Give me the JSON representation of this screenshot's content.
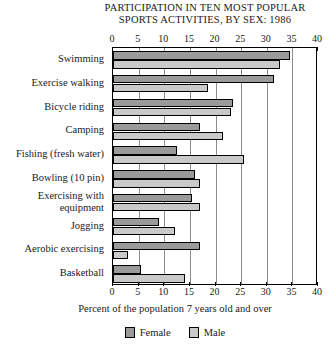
{
  "chart_data": {
    "type": "bar",
    "orientation": "horizontal",
    "title_line1": "PARTICIPATION IN TEN MOST POPULAR",
    "title_line2": "SPORTS ACTIVITIES, BY SEX: 1986",
    "xlabel": "Percent of the population 7 years old and over",
    "ylabel": "",
    "xlim": [
      0,
      40
    ],
    "xticks": [
      0,
      5,
      10,
      15,
      20,
      25,
      30,
      35,
      40
    ],
    "xtick_labels": [
      "0",
      "5",
      "10",
      "15",
      "20",
      "25",
      "30",
      "35",
      "40"
    ],
    "grid": true,
    "legend_position": "bottom",
    "categories": [
      "Swimming",
      "Exercise walking",
      "Bicycle riding",
      "Camping",
      "Fishing (fresh water)",
      "Bowling (10 pin)",
      "Exercising with equipment",
      "Jogging",
      "Aerobic exercising",
      "Basketball"
    ],
    "series": [
      {
        "name": "Female",
        "color": "#9a9a9a",
        "values": [
          34.5,
          31.5,
          23.5,
          17.0,
          12.5,
          16.0,
          15.5,
          9.0,
          17.0,
          5.5
        ]
      },
      {
        "name": "Male",
        "color": "#c9c9c9",
        "values": [
          32.5,
          18.5,
          23.0,
          21.5,
          25.5,
          17.0,
          17.0,
          12.0,
          3.0,
          14.0
        ]
      }
    ]
  }
}
